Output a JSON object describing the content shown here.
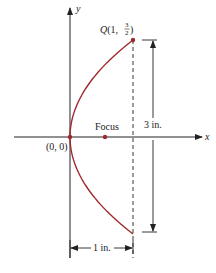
{
  "diagram": {
    "type": "parabola-dimension-figure",
    "axes": {
      "x_label": "x",
      "y_label": "y"
    },
    "origin_label": "(0, 0)",
    "focus_label": "Focus",
    "point_q": {
      "name": "Q",
      "label_prefix": "Q(1, ",
      "frac_num": "3",
      "frac_den": "2",
      "label_suffix": ")"
    },
    "height_dimension": "3 in.",
    "width_dimension": "1 in.",
    "colors": {
      "curve": "#a0282d",
      "axes": "#222222",
      "points": "#a0282d"
    },
    "equation_implied": "y^2 = (9/4) x",
    "math": {
      "vertex": [
        0,
        0
      ],
      "q_point": [
        1,
        1.5
      ],
      "focus": [
        0.5625,
        0
      ]
    }
  }
}
